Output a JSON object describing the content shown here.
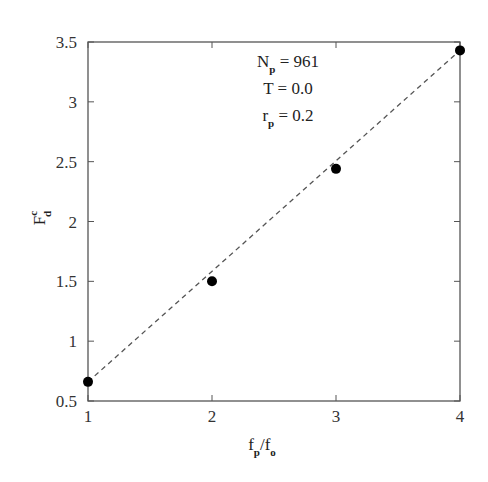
{
  "chart_data": {
    "type": "scatter",
    "title": "",
    "xlabel": "f_p/f_o",
    "ylabel": "F_d^c",
    "xlim": [
      1,
      4
    ],
    "ylim": [
      0.5,
      3.5
    ],
    "grid": false,
    "x_ticks": [
      "1",
      "2",
      "3",
      "4"
    ],
    "y_ticks": [
      "0.5",
      "1",
      "1.5",
      "2",
      "2.5",
      "3",
      "3.5"
    ],
    "series": [
      {
        "name": "data",
        "style": "filled-circle",
        "x": [
          1,
          2,
          3,
          4
        ],
        "y": [
          0.66,
          1.5,
          2.44,
          3.43
        ]
      },
      {
        "name": "fit",
        "style": "dashed-line",
        "x": [
          1,
          4
        ],
        "y": [
          0.66,
          3.43
        ]
      }
    ],
    "annotations": [
      {
        "main": "N",
        "sub": "p",
        "rest": " = 961"
      },
      {
        "main": "T",
        "sub": "",
        "rest": " = 0.0"
      },
      {
        "main": "r",
        "sub": "p",
        "rest": " = 0.2"
      }
    ]
  },
  "labels": {
    "x_main1": "f",
    "x_sub1": "p",
    "x_slash": "/f",
    "x_sub2": "o",
    "y_main": "F",
    "y_sup": "c",
    "y_sub": "d"
  }
}
